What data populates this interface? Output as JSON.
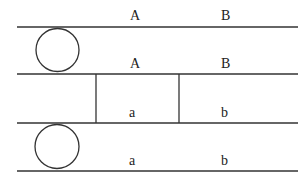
{
  "diagram": {
    "stroke_color": "#333333",
    "rows": [
      {
        "id": "row-1",
        "labels": [
          "A",
          "B"
        ],
        "has_circle": true
      },
      {
        "id": "row-2",
        "labels": [
          "A",
          "B"
        ],
        "has_circle": false,
        "has_box": true
      },
      {
        "id": "row-3",
        "labels": [
          "a",
          "b"
        ],
        "has_circle": true
      }
    ],
    "top_labels": [
      "A",
      "B"
    ],
    "row1_bottom_labels": [
      "A",
      "B"
    ],
    "row2_bottom_labels": [
      "a",
      "b"
    ],
    "row3_bottom_labels": [
      "a",
      "b"
    ]
  }
}
